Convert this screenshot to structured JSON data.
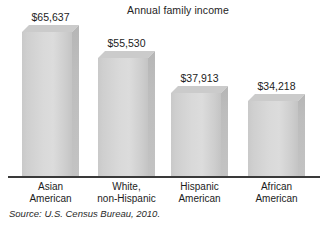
{
  "chart_data": {
    "type": "bar",
    "title": "Annual family income",
    "xlabel": "",
    "ylabel": "",
    "grid": false,
    "legend": null,
    "axis_visible": "x-only",
    "ylim": [
      0,
      72000
    ],
    "categories": [
      "Asian American",
      "White, non-Hispanic",
      "Hispanic American",
      "African American"
    ],
    "category_lines": [
      [
        "Asian",
        "American"
      ],
      [
        "White,",
        "non-Hispanic"
      ],
      [
        "Hispanic",
        "American"
      ],
      [
        "African",
        "American"
      ]
    ],
    "values": [
      65637,
      55530,
      37913,
      34218
    ],
    "value_labels": [
      "$65,637",
      "$55,530",
      "$37,913",
      "$34,218"
    ],
    "source": "Source: U.S. Census Bureau, 2010.",
    "bar_style": "3d-extruded-gray"
  },
  "colors": {
    "background": "#ffffff",
    "bar_face_light": "#dcdcdc",
    "bar_face_dark": "#c4c4c4",
    "bar_side": "#bdbdbd",
    "bar_top": "#cbcbcb",
    "axis": "#3a3a3a",
    "text": "#1c1c1c"
  },
  "bars": [
    {
      "label": "Asian American",
      "value_label": "$65,637",
      "line1": "Asian",
      "line2": "American",
      "left": 22,
      "width": 57,
      "height": 153
    },
    {
      "label": "White, non-Hispanic",
      "value_label": "$55,530",
      "line1": "White,",
      "line2": "non-Hispanic",
      "left": 98,
      "width": 57,
      "height": 127
    },
    {
      "label": "Hispanic American",
      "value_label": "$37,913",
      "line1": "Hispanic",
      "line2": "American",
      "left": 171,
      "width": 57,
      "height": 92
    },
    {
      "label": "African American",
      "value_label": "$34,218",
      "line1": "African",
      "line2": "American",
      "left": 248,
      "width": 57,
      "height": 84
    }
  ]
}
